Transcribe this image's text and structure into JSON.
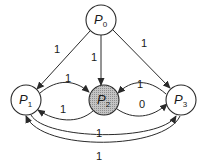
{
  "diagram": {
    "type": "weighted-directed-graph",
    "colors": {
      "node_fill": "#ffffff",
      "highlight_fill": "#bdbdbd",
      "stroke": "#2a2a2a"
    },
    "nodes": [
      {
        "id": "P0",
        "base": "P",
        "sub": "0",
        "highlighted": false
      },
      {
        "id": "P1",
        "base": "P",
        "sub": "1",
        "highlighted": false
      },
      {
        "id": "P2",
        "base": "P",
        "sub": "2",
        "highlighted": true
      },
      {
        "id": "P3",
        "base": "P",
        "sub": "3",
        "highlighted": false
      }
    ],
    "edges": [
      {
        "from": "P0",
        "to": "P1",
        "weight": "1"
      },
      {
        "from": "P0",
        "to": "P2",
        "weight": "1"
      },
      {
        "from": "P0",
        "to": "P3",
        "weight": "1"
      },
      {
        "from": "P1",
        "to": "P2",
        "weight": "1"
      },
      {
        "from": "P2",
        "to": "P1",
        "weight": "1"
      },
      {
        "from": "P3",
        "to": "P2",
        "weight": "1"
      },
      {
        "from": "P2",
        "to": "P3",
        "weight": "0"
      },
      {
        "from": "P1",
        "to": "P3",
        "weight": "1"
      },
      {
        "from": "P3",
        "to": "P1",
        "weight": "1"
      }
    ]
  }
}
